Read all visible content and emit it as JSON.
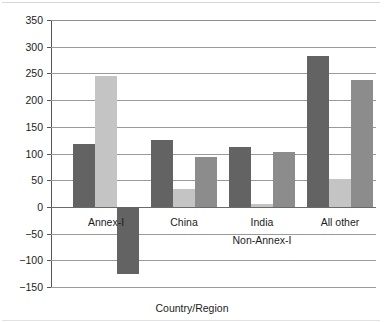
{
  "chart_data": {
    "type": "bar",
    "title": "",
    "subtitle": "",
    "xlabel": "Country/Region",
    "ylabel": "Gt Carbon",
    "categories": [
      "Annex-I",
      "China",
      "India",
      "All other"
    ],
    "series": [
      {
        "name": "series-1",
        "color": "#636363",
        "values": [
          118,
          125,
          113,
          283
        ]
      },
      {
        "name": "series-2",
        "color": "#c4c4c4",
        "values": [
          246,
          34,
          6,
          52
        ]
      },
      {
        "name": "series-3",
        "color": "#8c8c8c",
        "values": [
          -125,
          93,
          103,
          238
        ]
      }
    ],
    "series_overrides": [
      {
        "series": 2,
        "category": 0,
        "color": "#636363"
      }
    ],
    "ylim": [
      -150,
      350
    ],
    "ytick_values": [
      350,
      300,
      250,
      200,
      150,
      100,
      50,
      0,
      -50,
      -100,
      -150
    ],
    "ytick_labels": [
      "350",
      "300",
      "250",
      "200",
      "150",
      "100",
      "50",
      "0",
      "−50",
      "−100",
      "−150"
    ],
    "grid": true,
    "grid_axis": "y",
    "legend": "none",
    "legend_position": "none",
    "annotations": [
      {
        "name": "group-bracket-label",
        "text": "Non-Annex-I",
        "covers": [
          "China",
          "India",
          "All other"
        ]
      }
    ],
    "colors": {
      "series_1": "#636363",
      "series_2": "#c4c4c4",
      "series_3": "#8c8c8c",
      "gridline": "#9a9a9a",
      "axis": "#555555",
      "text": "#1c1c1c",
      "background": "#ffffff"
    }
  }
}
